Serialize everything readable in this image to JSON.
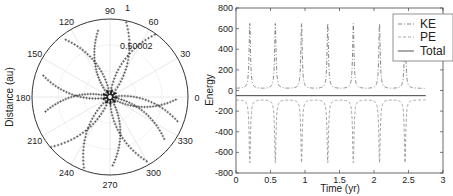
{
  "chart_data": [
    {
      "type": "scatter",
      "subtype": "polar",
      "title": "",
      "ylabel": "Distance (au)",
      "angle_ticks": [
        "0",
        "30",
        "60",
        "90",
        "120",
        "150",
        "180",
        "210",
        "240",
        "270",
        "300",
        "330"
      ],
      "radial_ticks": [
        "0.50002",
        "1"
      ],
      "description": "Polar trajectory plotted with '+' markers forming a rosette of orbit arms around the origin"
    },
    {
      "type": "line",
      "title": "",
      "xlabel": "Time (yr)",
      "ylabel": "Energy",
      "xlim": [
        0,
        3
      ],
      "ylim": [
        -800,
        800
      ],
      "xticks": [
        "0",
        "0.5",
        "1",
        "1.5",
        "2",
        "2.5",
        "3"
      ],
      "yticks": [
        "800",
        "600",
        "400",
        "200",
        "0",
        "-200",
        "-400",
        "-600",
        "-800"
      ],
      "legend": {
        "position": "upper right",
        "entries": [
          "KE",
          "PE",
          "Total"
        ]
      },
      "spike_times": [
        0.2,
        0.57,
        0.95,
        1.33,
        1.7,
        2.08,
        2.45
      ],
      "series": [
        {
          "name": "KE",
          "style": "dash-dot",
          "baseline": 0,
          "spike_peak": 650
        },
        {
          "name": "PE",
          "style": "dashed",
          "baseline": -90,
          "spike_peak": -700
        },
        {
          "name": "Total",
          "style": "solid",
          "values_constant": -50
        }
      ],
      "t_end": 2.75
    }
  ],
  "polar": {
    "ylabel": "Distance (au)",
    "angles": [
      {
        "label": "0",
        "deg": 0
      },
      {
        "label": "30",
        "deg": 30
      },
      {
        "label": "60",
        "deg": 60
      },
      {
        "label": "90",
        "deg": 90
      },
      {
        "label": "120",
        "deg": 120
      },
      {
        "label": "150",
        "deg": 150
      },
      {
        "label": "180",
        "deg": 180
      },
      {
        "label": "210",
        "deg": 210
      },
      {
        "label": "240",
        "deg": 240
      },
      {
        "label": "270",
        "deg": 270
      },
      {
        "label": "300",
        "deg": 300
      },
      {
        "label": "330",
        "deg": 330
      }
    ],
    "r_label_inner": "0.50002",
    "r_label_outer": "1"
  },
  "energy": {
    "xlabel": "Time (yr)",
    "ylabel": "Energy",
    "legend": [
      "KE",
      "PE",
      "Total"
    ]
  }
}
